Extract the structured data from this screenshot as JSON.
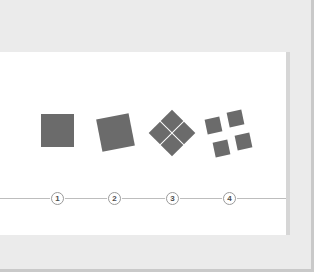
{
  "canvas": {
    "width": 319,
    "height": 279,
    "page_background": "#ebebeb",
    "card_background": "#ffffff",
    "card_edge_color": "#d6d6d6"
  },
  "timeline": {
    "line_color": "#bdbdbd",
    "marker_fill": "#ffffff",
    "marker_border": "#9a9a9a",
    "marker_text_color": "#4d4d4d",
    "markers": [
      {
        "label": "1",
        "name": "step-marker-1"
      },
      {
        "label": "2",
        "name": "step-marker-2"
      },
      {
        "label": "3",
        "name": "step-marker-3"
      },
      {
        "label": "4",
        "name": "step-marker-4"
      }
    ]
  },
  "diagram": {
    "shape_fill": "#6b6b6b",
    "steps": [
      {
        "step": "1",
        "name": "shape-group-single-square",
        "description": "one solid square",
        "count": 1
      },
      {
        "step": "2",
        "name": "shape-group-rotated-square",
        "description": "one solid square rotated",
        "count": 1
      },
      {
        "step": "3",
        "name": "shape-group-four-diamonds",
        "description": "four diamonds arranged in a rosette",
        "count": 4
      },
      {
        "step": "4",
        "name": "shape-group-four-separated-squares",
        "description": "four separated rotated squares",
        "count": 4
      }
    ]
  }
}
